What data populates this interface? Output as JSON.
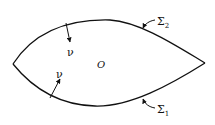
{
  "diagram": {
    "region_label": "O",
    "normal_top_label": "ν",
    "normal_bottom_label": "ν",
    "boundary_upper": {
      "symbol": "Σ",
      "subscript": "2"
    },
    "boundary_lower": {
      "symbol": "Σ",
      "subscript": "1"
    },
    "stroke_color": "#111111",
    "background": "#ffffff"
  }
}
